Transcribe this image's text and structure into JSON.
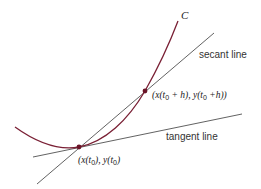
{
  "diagram": {
    "curve": {
      "label": "C",
      "color": "#7a2035"
    },
    "lines": {
      "color": "#3a3a3a",
      "secant": {
        "label": "secant line"
      },
      "tangent": {
        "label": "tangent line"
      }
    },
    "points": [
      {
        "name": "p0",
        "label_parts": [
          "(x(t",
          "0",
          "), y(t",
          "0",
          ")"
        ],
        "label_text": "(x(t0), y(t0)"
      },
      {
        "name": "p1",
        "label_parts": [
          "(x(t",
          "0",
          " + h), y(t",
          "0",
          " +h))"
        ],
        "label_text": "(x(t0 + h), y(t0 +h))"
      }
    ],
    "point_color": "#6a1528"
  }
}
